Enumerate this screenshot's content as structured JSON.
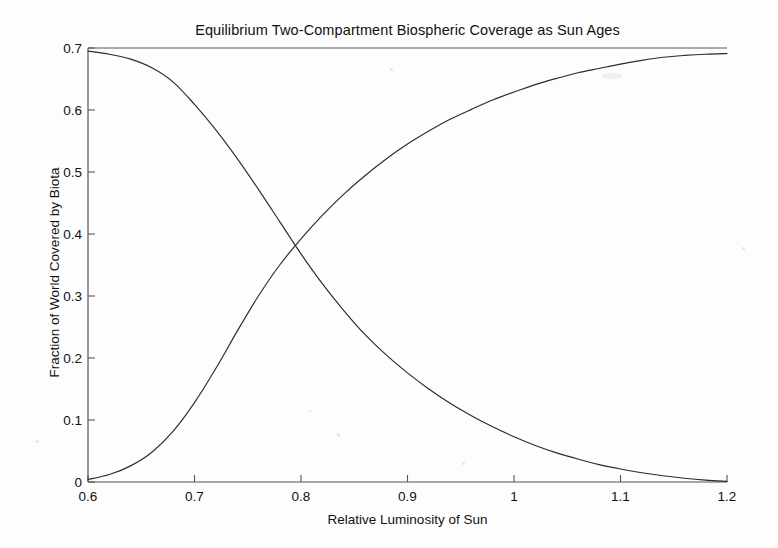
{
  "chart_data": {
    "type": "line",
    "title": "Equilibrium Two-Compartment Biospheric Coverage as Sun Ages",
    "xlabel": "Relative Luminosity of Sun",
    "ylabel": "Fraction of World Covered by Biota",
    "xlim": [
      0.6,
      1.2
    ],
    "ylim": [
      0,
      0.7
    ],
    "xticks": [
      0.6,
      0.7,
      0.8,
      0.9,
      1,
      1.1,
      1.2
    ],
    "xtick_labels": [
      "0.6",
      "0.7",
      "0.8",
      "0.9",
      "1",
      "1.1",
      "1.2"
    ],
    "yticks": [
      0,
      0.1,
      0.2,
      0.3,
      0.4,
      0.5,
      0.6,
      0.7
    ],
    "ytick_labels": [
      "0",
      "0.1",
      "0.2",
      "0.3",
      "0.4",
      "0.5",
      "0.6",
      "0.7"
    ],
    "grid": false,
    "legend": null,
    "line_color": "#2b2b2b",
    "background_color": "#fdfdfd",
    "axis_color": "#555555",
    "x": [
      0.6,
      0.62,
      0.64,
      0.66,
      0.68,
      0.7,
      0.72,
      0.74,
      0.76,
      0.78,
      0.8,
      0.82,
      0.84,
      0.86,
      0.88,
      0.9,
      0.92,
      0.94,
      0.96,
      0.98,
      1.0,
      1.02,
      1.04,
      1.06,
      1.08,
      1.1,
      1.12,
      1.14,
      1.16,
      1.18,
      1.2
    ],
    "series": [
      {
        "name": "declining-compartment",
        "values": [
          0.695,
          0.69,
          0.682,
          0.668,
          0.645,
          0.609,
          0.568,
          0.522,
          0.472,
          0.42,
          0.368,
          0.32,
          0.277,
          0.238,
          0.205,
          0.176,
          0.15,
          0.127,
          0.107,
          0.089,
          0.073,
          0.059,
          0.047,
          0.037,
          0.028,
          0.021,
          0.015,
          0.01,
          0.006,
          0.003,
          0.001
        ]
      },
      {
        "name": "rising-compartment",
        "values": [
          0.004,
          0.012,
          0.026,
          0.048,
          0.082,
          0.128,
          0.183,
          0.243,
          0.3,
          0.35,
          0.392,
          0.43,
          0.464,
          0.494,
          0.521,
          0.545,
          0.566,
          0.585,
          0.601,
          0.616,
          0.629,
          0.641,
          0.651,
          0.66,
          0.667,
          0.674,
          0.68,
          0.685,
          0.688,
          0.69,
          0.691
        ]
      }
    ],
    "crossing_point": {
      "x": 0.8,
      "y": 0.34
    }
  }
}
